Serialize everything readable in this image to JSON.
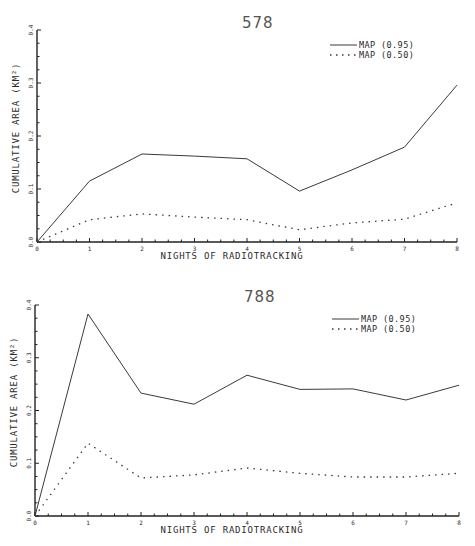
{
  "chart_data": [
    {
      "type": "line",
      "title": "578",
      "xlabel": "NIGHTS OF RADIOTRACKING",
      "ylabel": "CUMULATIVE AREA (KM²)",
      "x": [
        0,
        1,
        2,
        3,
        4,
        5,
        6,
        7,
        8
      ],
      "xticks": [
        "0",
        "1",
        "2",
        "3",
        "4",
        "5",
        "6",
        "7",
        "8"
      ],
      "yticks": [
        "0.0",
        "0.1",
        "0.2",
        "0.3",
        "0.4"
      ],
      "xlim": [
        0,
        8
      ],
      "ylim": [
        0,
        0.4
      ],
      "grid": false,
      "legend_position": "upper right",
      "series": [
        {
          "name": "MAP (0.95)",
          "style": "solid",
          "values": [
            0.0,
            0.115,
            0.166,
            0.162,
            0.157,
            0.096,
            0.136,
            0.179,
            0.296
          ]
        },
        {
          "name": "MAP (0.50)",
          "style": "dotted",
          "values": [
            0.0,
            0.042,
            0.053,
            0.047,
            0.042,
            0.023,
            0.036,
            0.043,
            0.074
          ]
        }
      ]
    },
    {
      "type": "line",
      "title": "788",
      "xlabel": "NIGHTS OF RADIOTRACKING",
      "ylabel": "CUMULATIVE AREA (KM²)",
      "x": [
        0,
        1,
        2,
        3,
        4,
        5,
        6,
        7,
        8
      ],
      "xticks": [
        "0",
        "1",
        "2",
        "3",
        "4",
        "5",
        "6",
        "7",
        "8"
      ],
      "yticks": [
        "0.0",
        "0.1",
        "0.2",
        "0.3",
        "0.4"
      ],
      "xlim": [
        0,
        8
      ],
      "ylim": [
        0,
        0.4
      ],
      "grid": false,
      "legend_position": "upper right",
      "series": [
        {
          "name": "MAP (0.95)",
          "style": "solid",
          "values": [
            0.0,
            0.383,
            0.233,
            0.212,
            0.267,
            0.24,
            0.241,
            0.22,
            0.248
          ]
        },
        {
          "name": "MAP (0.50)",
          "style": "dotted",
          "values": [
            0.0,
            0.138,
            0.072,
            0.078,
            0.091,
            0.081,
            0.074,
            0.074,
            0.081
          ]
        }
      ]
    }
  ],
  "colors": {
    "line": "#3a3a3a",
    "axis": "#222222",
    "background": "#ffffff"
  }
}
